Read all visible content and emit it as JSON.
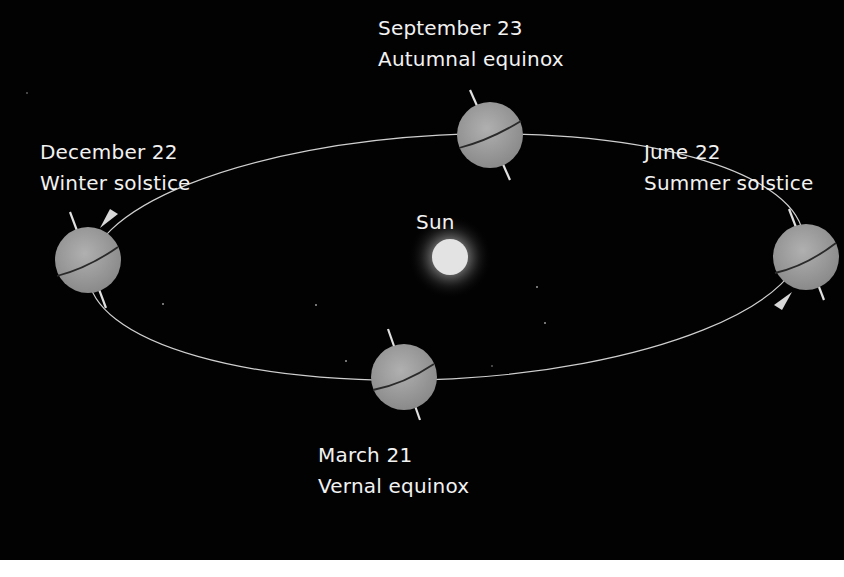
{
  "diagram": {
    "colors": {
      "background": "#020202",
      "text": "#f2f2f2",
      "orbit_line": "#cfcfcf",
      "planet_fill": "#9a9a9a",
      "equator_line": "#2a2a2a",
      "sun_core": "#e6e6e6",
      "sun_glow": "#ffffff"
    },
    "sun": {
      "label": "Sun"
    },
    "positions": [
      {
        "id": "september",
        "date": "September 23",
        "event": "Autumnal equinox"
      },
      {
        "id": "december",
        "date": "December 22",
        "event": "Winter solstice"
      },
      {
        "id": "june",
        "date": "June 22",
        "event": "Summer solstice"
      },
      {
        "id": "march",
        "date": "March 21",
        "event": "Vernal equinox"
      }
    ],
    "icons": {
      "earth": "earth-globe-icon",
      "sun": "sun-icon",
      "orbit_arrow": "orbit-direction-arrow-icon"
    }
  }
}
